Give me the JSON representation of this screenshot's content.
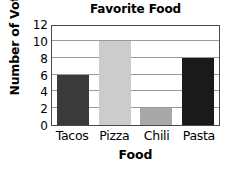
{
  "chart_data": {
    "type": "bar",
    "title": "Favorite Food",
    "xlabel": "Food",
    "ylabel": "Number of Votes",
    "categories": [
      "Tacos",
      "Pizza",
      "Chili",
      "Pasta"
    ],
    "values": [
      6,
      10,
      2,
      8
    ],
    "bar_colors": [
      "#3a3a3a",
      "#cccccc",
      "#a8a8a8",
      "#1a1a1a"
    ],
    "ylim": [
      0,
      12
    ],
    "ytick_labels": [
      "0",
      "2",
      "4",
      "6",
      "8",
      "10",
      "12"
    ],
    "ytick_values": [
      0,
      2,
      4,
      6,
      8,
      10,
      12
    ],
    "grid": true,
    "grid_orientation": "horizontal",
    "legend": null,
    "background_color": "#ffffff",
    "frame_color": "#4a4a4a",
    "gridline_color": "#9a9a9a",
    "text_color": "#000000"
  }
}
